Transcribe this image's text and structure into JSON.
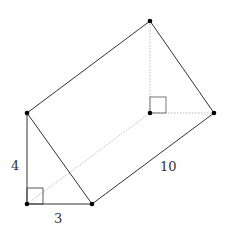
{
  "diagram": {
    "type": "triangular-prism",
    "labels": {
      "height": "4",
      "base": "3",
      "length": "10"
    },
    "vertices": {
      "front_top": [
        27,
        113
      ],
      "front_right_angle": [
        27,
        204
      ],
      "front_base_end": [
        92,
        204
      ],
      "back_top": [
        150,
        21
      ],
      "back_right_angle": [
        150,
        113
      ],
      "back_base_end": [
        214,
        113
      ]
    },
    "colors": {
      "edge": "#333333",
      "hidden_edge": "#bbbbbb",
      "vertex": "#000000"
    }
  }
}
